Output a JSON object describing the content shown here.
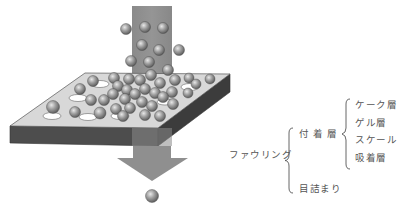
{
  "figure": {
    "colors": {
      "flow_column": "#8c8c8c",
      "plate_top": "#d9d9d9",
      "plate_front": "#4a4a4a",
      "plate_side": "#3a3a3a",
      "particle": "#9a9a9a",
      "pore": "#ffffff",
      "arrow": "#8f8f8f"
    }
  },
  "classification": {
    "root": "ファウリング",
    "branches": [
      {
        "label": "付 着 層",
        "children": [
          "ケーク層",
          "ゲル層",
          "スケール",
          "吸着層"
        ]
      },
      {
        "label": "目詰まり",
        "children": []
      }
    ]
  }
}
